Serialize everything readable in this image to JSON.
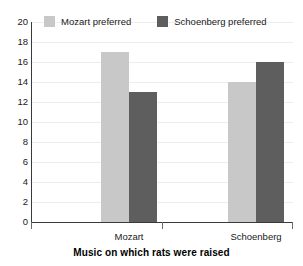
{
  "chart_data": {
    "type": "bar",
    "title": "",
    "subtitle": "",
    "xlabel": "Music on which rats were raised",
    "ylabel": "",
    "categories": [
      "Mozart",
      "Schoenberg"
    ],
    "series": [
      {
        "name": "Mozart preferred",
        "values": [
          17,
          14
        ],
        "color": "#c8c8c8"
      },
      {
        "name": "Schoenberg preferred",
        "values": [
          13,
          16
        ],
        "color": "#5e5e5e"
      }
    ],
    "ylim": [
      0,
      20
    ],
    "ytick_labels": [
      "20",
      "18",
      "16",
      "14",
      "12",
      "10",
      "8",
      "6",
      "4",
      "2",
      "0"
    ],
    "ytick_values": [
      20,
      18,
      16,
      14,
      12,
      10,
      8,
      6,
      4,
      2,
      0
    ],
    "grid": true,
    "grid_color": "#ededed",
    "legend_position": "top-left-inside",
    "axis_color": "#3a3a3a",
    "background": "#ffffff"
  },
  "legend": {
    "entries": [
      {
        "label": "Mozart preferred",
        "swatch": "#c8c8c8"
      },
      {
        "label": "Schoenberg preferred",
        "swatch": "#5e5e5e"
      }
    ]
  },
  "axis": {
    "x_title": "Music on which rats were raised",
    "categories": [
      "Mozart",
      "Schoenberg"
    ],
    "y_ticks": [
      "20",
      "18",
      "16",
      "14",
      "12",
      "10",
      "8",
      "6",
      "4",
      "2",
      "0"
    ]
  }
}
